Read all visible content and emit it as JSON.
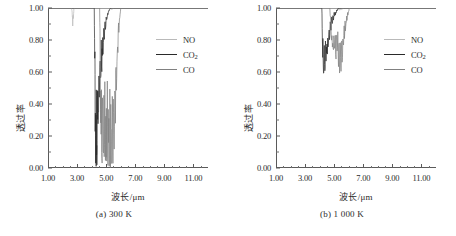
{
  "figure": {
    "panels": [
      {
        "id": "panel-a",
        "caption": "(a) 300 K",
        "temperature": "300 K",
        "xlabel": "波长/μm",
        "ylabel": "透过率"
      },
      {
        "id": "panel-b",
        "caption": "(b) 1 000 K",
        "temperature": "1 000 K",
        "xlabel": "波长/μm",
        "ylabel": "透过率"
      }
    ],
    "legend": {
      "entries": [
        {
          "label": "NO",
          "sub": "",
          "color": "#b9b9b9"
        },
        {
          "label": "CO",
          "sub": "2",
          "color": "#2a2a2a"
        },
        {
          "label": "CO",
          "sub": "",
          "color": "#808080"
        }
      ]
    },
    "axis_ticks": {
      "y_major": [
        "0.00",
        "0.20",
        "0.40",
        "0.60",
        "0.80",
        "1.00"
      ],
      "x_major": [
        "1.00",
        "3.00",
        "5.00",
        "7.00",
        "9.00",
        "11.00"
      ]
    },
    "colors": {
      "axis": "#5a5a5a",
      "text": "#2b2b2b",
      "no": "#b9b9b9",
      "co2": "#2a2a2a",
      "co": "#808080"
    }
  },
  "chart_data": [
    {
      "type": "line",
      "panel": "a",
      "title": "(a) 300 K",
      "xlabel": "波长/μm",
      "ylabel": "透过率",
      "xlim": [
        1.0,
        12.0
      ],
      "ylim": [
        0.0,
        1.0
      ],
      "xticks": [
        1.0,
        3.0,
        5.0,
        7.0,
        9.0,
        11.0
      ],
      "yticks": [
        0.0,
        0.2,
        0.4,
        0.6,
        0.8,
        1.0
      ],
      "grid": false,
      "legend_position": "upper right",
      "series": [
        {
          "name": "NO",
          "color": "#b9b9b9",
          "x": [
            1.0,
            2.6,
            2.66,
            2.7,
            2.74,
            2.78,
            2.84,
            2.95,
            5.2,
            5.3,
            5.4,
            5.55,
            12.0
          ],
          "values": [
            1.0,
            1.0,
            0.97,
            0.88,
            0.93,
            0.99,
            1.0,
            1.0,
            1.0,
            0.995,
            0.99,
            1.0,
            1.0
          ]
        },
        {
          "name": "CO2",
          "color": "#2a2a2a",
          "x": [
            1.0,
            4.18,
            4.22,
            4.25,
            4.28,
            4.32,
            4.36,
            4.4,
            4.45,
            4.55,
            4.62,
            4.7,
            4.78,
            4.85,
            4.95,
            5.05,
            5.15,
            5.3,
            12.0
          ],
          "values": [
            1.0,
            1.0,
            0.55,
            0.0,
            0.0,
            0.0,
            0.0,
            0.02,
            0.3,
            0.4,
            0.52,
            0.6,
            0.7,
            0.78,
            0.86,
            0.92,
            0.97,
            1.0,
            1.0
          ]
        },
        {
          "name": "CO",
          "color": "#808080",
          "x": [
            1.0,
            4.55,
            4.6,
            4.65,
            4.72,
            4.82,
            4.95,
            5.1,
            5.25,
            5.4,
            5.55,
            5.7,
            5.85,
            6.0,
            12.0
          ],
          "values": [
            1.0,
            1.0,
            0.45,
            0.02,
            0.0,
            0.0,
            0.0,
            0.0,
            0.0,
            0.0,
            0.05,
            0.45,
            0.82,
            1.0,
            1.0
          ]
        }
      ],
      "notes": "Deep saturated absorption bands reaching zero transmittance near 4.3 μm (CO2) and 4.7–5.5 μm (CO); weak NO feature near 2.7 μm dipping to ~0.88."
    },
    {
      "type": "line",
      "panel": "b",
      "title": "(b) 1 000 K",
      "xlabel": "波长/μm",
      "ylabel": "透过率",
      "xlim": [
        1.0,
        12.0
      ],
      "ylim": [
        0.0,
        1.0
      ],
      "xticks": [
        1.0,
        3.0,
        5.0,
        7.0,
        9.0,
        11.0
      ],
      "yticks": [
        0.0,
        0.2,
        0.4,
        0.6,
        0.8,
        1.0
      ],
      "grid": false,
      "legend_position": "upper right",
      "series": [
        {
          "name": "NO",
          "color": "#b9b9b9",
          "x": [
            1.0,
            5.2,
            5.35,
            5.5,
            5.7,
            12.0
          ],
          "values": [
            1.0,
            1.0,
            0.985,
            0.99,
            1.0,
            1.0
          ]
        },
        {
          "name": "CO2",
          "color": "#2a2a2a",
          "x": [
            1.0,
            4.15,
            4.2,
            4.25,
            4.32,
            4.4,
            4.48,
            4.58,
            4.68,
            4.78,
            4.88,
            5.0,
            5.15,
            5.3,
            12.0
          ],
          "values": [
            1.0,
            1.0,
            0.72,
            0.51,
            0.58,
            0.62,
            0.68,
            0.74,
            0.8,
            0.86,
            0.9,
            0.94,
            0.97,
            1.0,
            1.0
          ]
        },
        {
          "name": "CO",
          "color": "#808080",
          "x": [
            1.0,
            4.7,
            4.8,
            4.9,
            5.0,
            5.1,
            5.2,
            5.32,
            5.42,
            5.52,
            5.62,
            5.75,
            5.9,
            6.05,
            12.0
          ],
          "values": [
            1.0,
            1.0,
            0.8,
            0.7,
            0.74,
            0.66,
            0.72,
            0.6,
            0.55,
            0.63,
            0.72,
            0.84,
            0.93,
            1.0,
            1.0
          ]
        }
      ],
      "notes": "At 1 000 K absorption is much weaker and broader; minimum transmittance about 0.51 near 4.25 μm and about 0.55 near 5.4 μm."
    }
  ]
}
